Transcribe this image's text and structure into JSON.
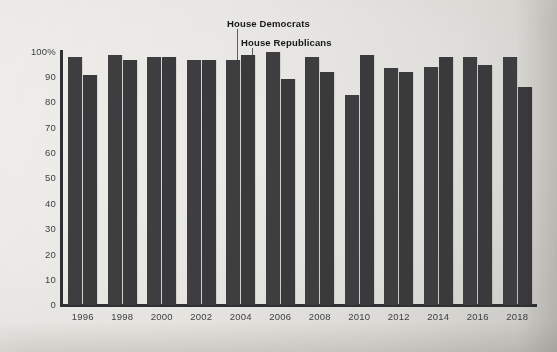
{
  "chart_data": {
    "type": "bar",
    "title": "",
    "subtitle": "",
    "xlabel": "",
    "ylabel": "",
    "ylim": [
      0,
      100
    ],
    "yticks": [
      "0",
      "10",
      "20",
      "30",
      "40",
      "50",
      "60",
      "70",
      "80",
      "90",
      "100%"
    ],
    "ytick_values": [
      0,
      10,
      20,
      30,
      40,
      50,
      60,
      70,
      80,
      90,
      100
    ],
    "grid": false,
    "legend_position": "annotation-callout",
    "categories": [
      "1996",
      "1998",
      "2000",
      "2002",
      "2004",
      "2006",
      "2008",
      "2010",
      "2012",
      "2014",
      "2016",
      "2018"
    ],
    "series": [
      {
        "name": "House Democrats",
        "color": "#3e3e40",
        "values": [
          98,
          99,
          98,
          97,
          97,
          100,
          98,
          83,
          93.5,
          94,
          98,
          98
        ]
      },
      {
        "name": "House Republicans",
        "color": "#3a3a3c",
        "values": [
          91,
          97,
          98,
          97,
          99,
          89.5,
          92,
          99,
          92,
          98,
          95,
          86
        ]
      }
    ],
    "annotations": [
      {
        "id": "dem",
        "text": "House Democrats",
        "points_to_series": "House Democrats",
        "points_to_category": "2004"
      },
      {
        "id": "rep",
        "text": "House Republicans",
        "points_to_series": "House Republicans",
        "points_to_category": "2004"
      }
    ]
  },
  "colors": {
    "background": "#e8e6e2",
    "bar": "#3c3c3e",
    "axis": "#2f3033",
    "text": "#404144",
    "annotation_text": "#17181a",
    "leader_line": "#5d5e60"
  }
}
